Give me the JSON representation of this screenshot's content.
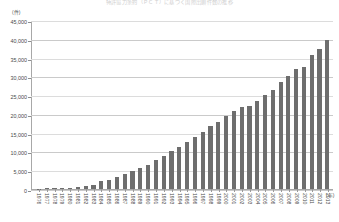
{
  "chart_data": {
    "type": "bar",
    "title": "特許協力条約（ＰＣＴ）に基づく国際出願件数の推移",
    "subtitle": "",
    "xlabel": "(年)",
    "ylabel": "(件)",
    "ylim": [
      0,
      45000
    ],
    "ytick_step": 5000,
    "ytick_labels": [
      "0",
      "5,000",
      "10,000",
      "15,000",
      "20,000",
      "25,000",
      "30,000",
      "35,000",
      "40,000",
      "45,000"
    ],
    "ytick_values": [
      0,
      5000,
      10000,
      15000,
      20000,
      25000,
      30000,
      35000,
      40000,
      45000
    ],
    "grid": true,
    "legend": false,
    "bar_color": "#6e6e6e",
    "axis_color": "#a8a8a8",
    "grid_color": "#dcdcdc",
    "categories": [
      "1976",
      "1977",
      "1978",
      "1979",
      "1980",
      "1981",
      "1982",
      "1983",
      "1984",
      "1985",
      "1986",
      "1987",
      "1988",
      "1989",
      "1990",
      "1991",
      "1992",
      "1993",
      "1994",
      "1995",
      "1996",
      "1997",
      "1998",
      "1999",
      "2000",
      "2001",
      "2002",
      "2003",
      "2004",
      "2005",
      "2006",
      "2007",
      "2008",
      "2009",
      "2010",
      "2011",
      "2012",
      "2013"
    ],
    "values": [
      120,
      180,
      230,
      280,
      400,
      520,
      700,
      1100,
      2100,
      2500,
      3100,
      4000,
      4900,
      5600,
      6300,
      7700,
      8900,
      10100,
      11200,
      12400,
      13800,
      15200,
      16700,
      17900,
      19500,
      20900,
      21800,
      22100,
      23500,
      25000,
      26400,
      28500,
      30100,
      31900,
      32400,
      35700,
      37300,
      39800
    ]
  }
}
